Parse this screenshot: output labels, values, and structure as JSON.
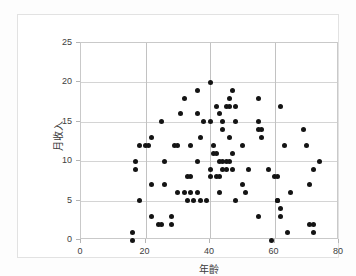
{
  "chart_data": {
    "type": "scatter",
    "title": "",
    "xlabel": "年齡",
    "ylabel": "月收入",
    "xlim": [
      0,
      80
    ],
    "ylim": [
      0,
      25
    ],
    "xticks": [
      0,
      20,
      40,
      60,
      80
    ],
    "yticks": [
      0,
      5,
      10,
      15,
      20,
      25
    ],
    "xtick_labels": [
      "0",
      "20",
      "40",
      "60",
      "80"
    ],
    "ytick_labels": [
      "0",
      "5",
      "10",
      "15",
      "20",
      "25"
    ],
    "grid": true,
    "legend": null,
    "marker": {
      "shape": "circle",
      "color": "#141414",
      "size": 5
    },
    "points": [
      [
        16,
        1
      ],
      [
        16,
        0
      ],
      [
        17,
        10
      ],
      [
        17,
        9
      ],
      [
        18,
        12
      ],
      [
        18,
        5
      ],
      [
        20,
        12
      ],
      [
        21,
        12
      ],
      [
        22,
        13
      ],
      [
        22,
        7
      ],
      [
        22,
        3
      ],
      [
        24,
        2
      ],
      [
        25,
        15
      ],
      [
        25,
        2
      ],
      [
        26,
        10
      ],
      [
        26,
        7
      ],
      [
        28,
        2
      ],
      [
        28,
        3
      ],
      [
        29,
        12
      ],
      [
        30,
        12
      ],
      [
        30,
        6
      ],
      [
        31,
        16
      ],
      [
        32,
        18
      ],
      [
        32,
        6
      ],
      [
        33,
        8
      ],
      [
        33,
        5
      ],
      [
        34,
        8
      ],
      [
        34,
        12
      ],
      [
        34,
        6
      ],
      [
        35,
        5
      ],
      [
        36,
        19
      ],
      [
        36,
        16
      ],
      [
        36,
        10
      ],
      [
        36,
        6
      ],
      [
        37,
        13
      ],
      [
        37,
        5
      ],
      [
        38,
        15
      ],
      [
        39,
        5
      ],
      [
        40,
        20
      ],
      [
        40,
        15
      ],
      [
        40,
        9
      ],
      [
        40,
        8
      ],
      [
        41,
        12
      ],
      [
        41,
        11
      ],
      [
        42,
        17
      ],
      [
        42,
        11
      ],
      [
        42,
        8
      ],
      [
        43,
        16
      ],
      [
        43,
        10
      ],
      [
        43,
        6
      ],
      [
        43,
        8
      ],
      [
        44,
        14
      ],
      [
        44,
        15
      ],
      [
        44,
        10
      ],
      [
        44,
        9
      ],
      [
        45,
        17
      ],
      [
        45,
        10
      ],
      [
        45,
        9
      ],
      [
        46,
        18
      ],
      [
        46,
        17
      ],
      [
        46,
        13
      ],
      [
        46,
        10
      ],
      [
        47,
        19
      ],
      [
        47,
        11
      ],
      [
        47,
        9
      ],
      [
        48,
        17
      ],
      [
        48,
        15
      ],
      [
        48,
        5
      ],
      [
        50,
        12
      ],
      [
        50,
        7
      ],
      [
        51,
        6
      ],
      [
        52,
        9
      ],
      [
        55,
        18
      ],
      [
        55,
        15
      ],
      [
        55,
        14
      ],
      [
        55,
        3
      ],
      [
        56,
        14
      ],
      [
        56,
        13
      ],
      [
        58,
        9
      ],
      [
        59,
        0
      ],
      [
        60,
        8
      ],
      [
        61,
        8
      ],
      [
        61,
        5
      ],
      [
        61,
        5
      ],
      [
        62,
        17
      ],
      [
        62,
        4
      ],
      [
        62,
        3
      ],
      [
        63,
        12
      ],
      [
        64,
        1
      ],
      [
        65,
        6
      ],
      [
        69,
        14
      ],
      [
        70,
        12
      ],
      [
        71,
        7
      ],
      [
        71,
        2
      ],
      [
        72,
        2
      ],
      [
        72,
        9
      ],
      [
        72,
        1
      ],
      [
        74,
        10
      ]
    ]
  }
}
